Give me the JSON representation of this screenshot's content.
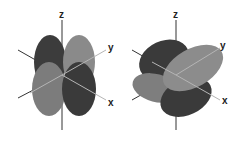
{
  "figures": [
    {
      "name": "orbital-left",
      "axes": {
        "z": "z",
        "y": "y",
        "x": "x"
      },
      "lobes": [
        {
          "cx": 50,
          "cy": 62,
          "rx": 16,
          "ry": 27,
          "rot": 0,
          "color": "#3c3c3c"
        },
        {
          "cx": 79,
          "cy": 62,
          "rx": 16,
          "ry": 27,
          "rot": 0,
          "color": "#8a8a8a"
        },
        {
          "cx": 49,
          "cy": 89,
          "rx": 17,
          "ry": 27,
          "rot": 0,
          "color": "#7c7c7c"
        },
        {
          "cx": 79,
          "cy": 89,
          "rx": 17,
          "ry": 27,
          "rot": 0,
          "color": "#3a3a3a"
        }
      ]
    },
    {
      "name": "orbital-right",
      "axes": {
        "z": "z",
        "y": "y",
        "x": "x"
      },
      "lobes": [
        {
          "cx": 164,
          "cy": 60,
          "rx": 26,
          "ry": 19,
          "rot": -25,
          "color": "#3a3a3a"
        },
        {
          "cx": 156,
          "cy": 88,
          "rx": 24,
          "ry": 14,
          "rot": 15,
          "color": "#7e7e7e"
        },
        {
          "cx": 186,
          "cy": 97,
          "rx": 27,
          "ry": 18,
          "rot": -25,
          "color": "#3a3a3a"
        },
        {
          "cx": 193,
          "cy": 68,
          "rx": 33,
          "ry": 19,
          "rot": -30,
          "color": "#8c8c8c"
        }
      ]
    }
  ],
  "colors": {
    "axis_dark": "#333333",
    "axis_light": "#b5b5b5",
    "background": "#ffffff"
  }
}
